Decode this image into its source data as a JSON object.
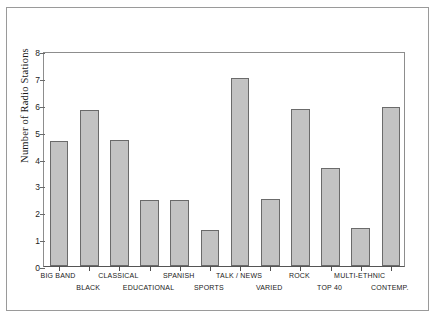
{
  "chart_data": {
    "type": "bar",
    "title": "",
    "xlabel": "",
    "ylabel": "Number of Radio Stations",
    "ylim": [
      0,
      8
    ],
    "yticks": [
      "0",
      "1",
      "2",
      "3",
      "4",
      "5",
      "6",
      "7",
      "8"
    ],
    "grid": false,
    "legend": "none",
    "bar_color": "#c3c3c3",
    "bar_edge_color": "#6b6b6b",
    "categories": [
      "BIG BAND",
      "BLACK",
      "CLASSICAL",
      "EDUCATIONAL",
      "SPANISH",
      "SPORTS",
      "TALK / NEWS",
      "VARIED",
      "ROCK",
      "TOP 40",
      "MULTI-ETHNIC",
      "CONTEMP."
    ],
    "values": [
      4.65,
      5.8,
      4.7,
      2.45,
      2.45,
      1.35,
      7.0,
      2.5,
      5.85,
      3.65,
      1.4,
      5.9
    ],
    "label_rows": [
      0,
      1,
      0,
      1,
      0,
      1,
      0,
      1,
      0,
      1,
      0,
      1
    ]
  }
}
